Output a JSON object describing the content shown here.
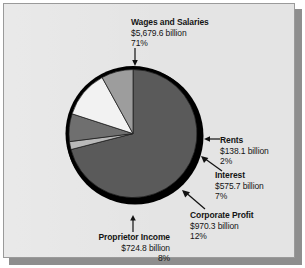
{
  "chart_data": {
    "type": "pie",
    "title": "",
    "labels": [
      "Wages and Salaries",
      "Rents",
      "Interest",
      "Corporate Profit",
      "Proprietor Income"
    ],
    "values": [
      5679.6,
      138.1,
      575.7,
      970.3,
      724.8
    ],
    "percentages": [
      71,
      2,
      7,
      12,
      8
    ],
    "value_unit": "billion",
    "value_prefix": "$",
    "legend": "none",
    "grid": false,
    "slices": [
      {
        "name": "Wages and Salaries",
        "amount": "$5,679.6 billion",
        "percent": "71%",
        "value": 5679.6,
        "percent_value": 71,
        "color": "#5a5a5a",
        "start_deg": 0,
        "sweep_deg": 255.6
      },
      {
        "name": "Rents",
        "amount": "$138.1 billion",
        "percent": "2%",
        "value": 138.1,
        "percent_value": 2,
        "color": "#b9b9b9",
        "start_deg": 255.6,
        "sweep_deg": 7.2
      },
      {
        "name": "Interest",
        "amount": "$575.7 billion",
        "percent": "7%",
        "value": 575.7,
        "percent_value": 7,
        "color": "#6f6f6f",
        "start_deg": 262.8,
        "sweep_deg": 25.2
      },
      {
        "name": "Corporate Profit",
        "amount": "$970.3 billion",
        "percent": "12%",
        "value": 970.3,
        "percent_value": 12,
        "color": "#f2f2f2",
        "start_deg": 288.0,
        "sweep_deg": 43.2
      },
      {
        "name": "Proprietor Income",
        "amount": "$724.8 billion",
        "percent": "8%",
        "value": 724.8,
        "percent_value": 8,
        "color": "#9d9d9d",
        "start_deg": 331.2,
        "sweep_deg": 28.8
      }
    ]
  },
  "panel": {
    "background_color": "#e4e4e4",
    "border_color": "#9a9a9a",
    "shadow_color": "#8e8e8e"
  },
  "pie_style": {
    "outline_color": "#000000",
    "rim_shadow_color": "#000000"
  },
  "callouts": {
    "wages": {
      "title": "Wages and Salaries",
      "amount": "$5,679.6 billion",
      "percent": "71%",
      "arrow": "arrow-down-icon"
    },
    "rents": {
      "title": "Rents",
      "amount": "$138.1 billion",
      "percent": "2%",
      "arrow": "arrow-left-icon"
    },
    "interest": {
      "title": "Interest",
      "amount": "$575.7 billion",
      "percent": "7%",
      "arrow": "arrow-up-left-icon"
    },
    "corporate": {
      "title": "Corporate Profit",
      "amount": "$970.3 billion",
      "percent": "12%",
      "arrow": "arrow-up-left-icon"
    },
    "proprietor": {
      "title": "Proprietor Income",
      "amount": "$724.8 billion",
      "percent": "8%",
      "arrow": "arrow-up-icon"
    }
  }
}
